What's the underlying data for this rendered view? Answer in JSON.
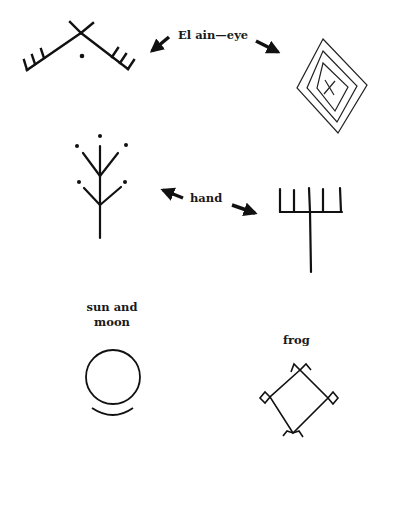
{
  "labels": {
    "eye": "El ain—eye",
    "hand": "hand",
    "sun_and_moon_line1": "sun and",
    "sun_and_moon_line2": "moon",
    "frog": "frog"
  },
  "symbols": [
    {
      "id": "eye-chevron",
      "description": "inverted V with crossed apex, comb-like tick marks at both ends, dot beneath apex"
    },
    {
      "id": "eye-diamond",
      "description": "three nested diamonds with an X in the center"
    },
    {
      "id": "hand-tree",
      "description": "vertical stem with two pairs of branches and five dots"
    },
    {
      "id": "hand-fork",
      "description": "five upward prongs on a horizontal bar atop a long stem"
    },
    {
      "id": "sun-and-moon",
      "description": "circle above a shallow crescent arc"
    },
    {
      "id": "frog",
      "description": "diamond with small squares on left/right corners and forked tips on top/bottom"
    }
  ],
  "colors": {
    "ink": "#111111",
    "background": "#ffffff"
  }
}
